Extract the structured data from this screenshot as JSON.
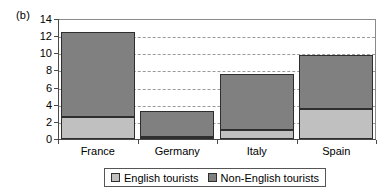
{
  "panel": {
    "label": "(b)"
  },
  "chart_data": {
    "type": "bar",
    "subtype": "stacked",
    "title": "",
    "xlabel": "",
    "ylabel": "",
    "ylim": [
      0,
      14
    ],
    "yticks": [
      0,
      2,
      4,
      6,
      8,
      10,
      12,
      14
    ],
    "ytick_labels": [
      "0",
      "2",
      "4",
      "6",
      "8",
      "10",
      "12",
      "14"
    ],
    "grid": true,
    "grid_axis": "y",
    "grid_style": "dashed",
    "legend_position": "bottom",
    "categories": [
      "France",
      "Germany",
      "Italy",
      "Spain"
    ],
    "series": [
      {
        "name": "English tourists",
        "color": "#c0c0c0",
        "values": [
          2.6,
          0.2,
          1.0,
          3.5
        ]
      },
      {
        "name": "Non-English tourists",
        "color": "#808080",
        "values": [
          9.9,
          3.1,
          6.6,
          6.35
        ]
      }
    ],
    "totals": [
      12.5,
      3.3,
      7.6,
      9.85
    ]
  },
  "legend": {
    "entries": [
      {
        "label": "English tourists",
        "color": "#c0c0c0"
      },
      {
        "label": "Non-English tourists",
        "color": "#808080"
      }
    ]
  }
}
